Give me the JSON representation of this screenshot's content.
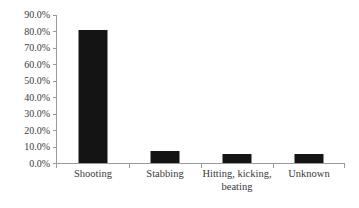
{
  "chart_data": {
    "type": "bar",
    "title": "",
    "subtitle": "",
    "xlabel": "",
    "ylabel": "",
    "categories": [
      "Shooting",
      "Stabbing",
      "Hitting, kicking, beating",
      "Unknown"
    ],
    "values": [
      81.0,
      8.0,
      6.0,
      6.0
    ],
    "value_labels": [
      "81.0%",
      "8.0%",
      "6.0%",
      "6.0%"
    ],
    "ylim": [
      0,
      90
    ],
    "ytick_values": [
      0,
      10,
      20,
      30,
      40,
      50,
      60,
      70,
      80,
      90
    ],
    "ytick_labels": [
      "0.0%",
      "10.0%",
      "20.0%",
      "30.0%",
      "40.0%",
      "50.0%",
      "60.0%",
      "70.0%",
      "80.0%",
      "90.0%"
    ],
    "grid": false,
    "legend": false,
    "legend_position": "none",
    "series": [
      {
        "name": "Percent",
        "values": [
          81.0,
          8.0,
          6.0,
          6.0
        ]
      }
    ],
    "category_label_lines": [
      [
        "Shooting"
      ],
      [
        "Stabbing"
      ],
      [
        "Hitting, kicking,",
        "beating"
      ],
      [
        "Unknown"
      ]
    ],
    "colors": {
      "bar": "#141414",
      "axis": "#9a9a9a",
      "text": "#3a3a3a",
      "background": "#ffffff"
    }
  }
}
